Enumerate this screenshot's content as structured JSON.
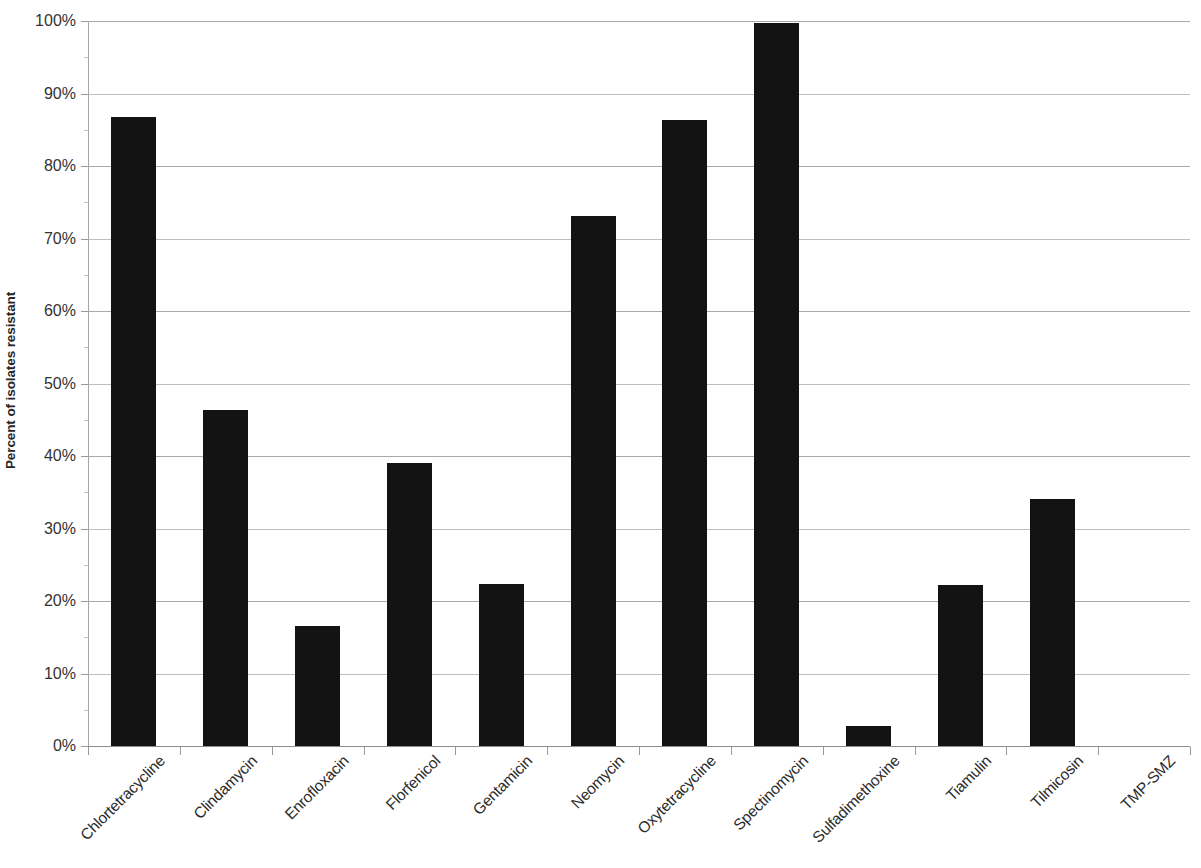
{
  "chart_data": {
    "type": "bar",
    "title": "",
    "subtitle": "",
    "xlabel": "",
    "ylabel": "Percent of isolates resistant",
    "ylim": [
      0,
      100
    ],
    "y_unit": "%",
    "grid": "horizontal",
    "legend": "none",
    "bar_color": "#131313",
    "categories": [
      "Chlortetracycline",
      "Clindamycin",
      "Enrofloxacin",
      "Florfenicol",
      "Gentamicin",
      "Neomycin",
      "Oxytetracycline",
      "Spectinomycin",
      "Sulfadimethoxine",
      "Tiamulin",
      "Tilmicosin",
      "TMP-SMZ"
    ],
    "values": [
      86.7,
      46.4,
      16.6,
      39.0,
      22.4,
      73.1,
      86.4,
      99.7,
      2.8,
      22.2,
      34.0,
      0.0
    ],
    "y_ticks": [
      {
        "value": 100,
        "label": "100%"
      },
      {
        "value": 90,
        "label": "90%"
      },
      {
        "value": 80,
        "label": "80%"
      },
      {
        "value": 70,
        "label": "70%"
      },
      {
        "value": 60,
        "label": "60%"
      },
      {
        "value": 50,
        "label": "50%"
      },
      {
        "value": 40,
        "label": "40%"
      },
      {
        "value": 30,
        "label": "30%"
      },
      {
        "value": 20,
        "label": "20%"
      },
      {
        "value": 10,
        "label": "10%"
      },
      {
        "value": 0,
        "label": "0%"
      }
    ],
    "minor_ticks": [
      95,
      85,
      75,
      65,
      55,
      45,
      35,
      25,
      15,
      5
    ]
  }
}
